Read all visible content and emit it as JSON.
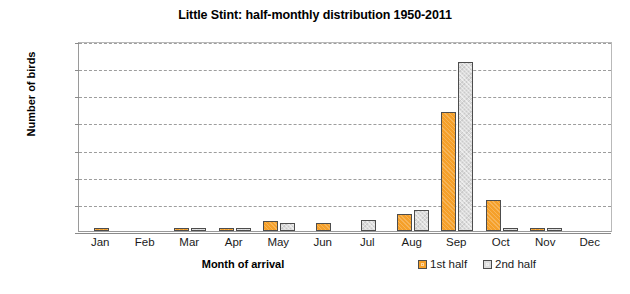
{
  "chart_data": {
    "type": "bar",
    "title": "Little Stint: half-monthly distribution 1950-2011",
    "xlabel": "Month of arrival",
    "ylabel": "Number of birds",
    "categories": [
      "Jan",
      "Feb",
      "Mar",
      "Apr",
      "May",
      "Jun",
      "Jul",
      "Aug",
      "Sep",
      "Oct",
      "Nov",
      "Dec"
    ],
    "series": [
      {
        "name": "1st half",
        "color": "#f5a02a",
        "values": [
          2,
          0,
          4,
          4,
          18,
          15,
          0,
          32,
          220,
          58,
          2,
          0
        ]
      },
      {
        "name": "2nd half",
        "color": "#dcdcdc",
        "values": [
          0,
          0,
          5,
          4,
          14,
          0,
          20,
          38,
          312,
          4,
          2,
          0
        ]
      }
    ],
    "ylim": [
      0,
      350
    ],
    "yticks": [
      0,
      50,
      100,
      150,
      200,
      250,
      300,
      350
    ],
    "ytick_labels": [
      "0",
      "50",
      "100",
      "150",
      "200",
      "250",
      "300",
      "350"
    ],
    "grid": true,
    "legend_position": "bottom-right"
  }
}
